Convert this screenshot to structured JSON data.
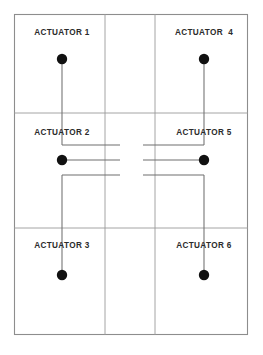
{
  "diagram": {
    "background_color": "#ffffff",
    "grid_line_color": "#9a9a9a",
    "wire_color": "#6f6f6f",
    "node_color": "#111111",
    "label_color": "#2b2b2b",
    "frame": {
      "x": 14,
      "y": 14,
      "width": 234,
      "height": 321
    },
    "columns": [
      {
        "id": "left",
        "x": 14,
        "width": 91
      },
      {
        "id": "center",
        "x": 105,
        "width": 50
      },
      {
        "id": "right",
        "x": 155,
        "width": 93
      }
    ],
    "rows": [
      {
        "id": "top",
        "y": 14,
        "height": 99
      },
      {
        "id": "middle",
        "y": 113,
        "height": 115
      },
      {
        "id": "bottom",
        "y": 228,
        "height": 107
      }
    ],
    "cells": [
      {
        "name": "actuator-1",
        "label": "ACTUATOR 1",
        "label_x": 62,
        "label_y": 33,
        "node_x": 62,
        "node_y": 59,
        "node_r": 5.2
      },
      {
        "name": "actuator-2",
        "label": "ACTUATOR 2",
        "label_x": 62,
        "label_y": 133,
        "node_x": 62,
        "node_y": 160,
        "node_r": 5.2
      },
      {
        "name": "actuator-3",
        "label": "ACTUATOR 3",
        "label_x": 62,
        "label_y": 246,
        "node_x": 62,
        "node_y": 275,
        "node_r": 5.2
      },
      {
        "name": "actuator-4",
        "label": "ACTUATOR  4",
        "label_x": 204,
        "label_y": 33,
        "node_x": 204,
        "node_y": 59,
        "node_r": 5.2
      },
      {
        "name": "actuator-5",
        "label": "ACTUATOR 5",
        "label_x": 204,
        "label_y": 133,
        "node_x": 204,
        "node_y": 160,
        "node_r": 5.2
      },
      {
        "name": "actuator-6",
        "label": "ACTUATOR 6",
        "label_x": 204,
        "label_y": 246,
        "node_x": 204,
        "node_y": 275,
        "node_r": 5.2
      }
    ],
    "wires": [
      {
        "name": "wire-actuator-1-down",
        "d": "M 62 59 L 62 145"
      },
      {
        "name": "wire-actuator-1-to-center",
        "d": "M 62 145 L 120 145"
      },
      {
        "name": "wire-actuator-2-to-center",
        "d": "M 62 160 L 120 160"
      },
      {
        "name": "wire-actuator-3-up",
        "d": "M 62 275 L 62 175"
      },
      {
        "name": "wire-actuator-3-to-center",
        "d": "M 62 175 L 120 175"
      },
      {
        "name": "wire-actuator-4-down",
        "d": "M 204 59 L 204 145"
      },
      {
        "name": "wire-actuator-4-to-center",
        "d": "M 204 145 L 143 145"
      },
      {
        "name": "wire-actuator-5-to-center",
        "d": "M 204 160 L 143 160"
      },
      {
        "name": "wire-actuator-6-up",
        "d": "M 204 275 L 204 175"
      },
      {
        "name": "wire-actuator-6-to-center",
        "d": "M 204 175 L 143 175"
      }
    ],
    "grid_lines": [
      {
        "name": "grid-column-divider-left",
        "x1": 105,
        "y1": 14,
        "x2": 105,
        "y2": 335
      },
      {
        "name": "grid-column-divider-right",
        "x1": 155,
        "y1": 14,
        "x2": 155,
        "y2": 335
      },
      {
        "name": "grid-row-divider-top",
        "x1": 14,
        "y1": 113,
        "x2": 248,
        "y2": 113
      },
      {
        "name": "grid-row-divider-bottom",
        "x1": 14,
        "y1": 228,
        "x2": 248,
        "y2": 228
      }
    ]
  }
}
